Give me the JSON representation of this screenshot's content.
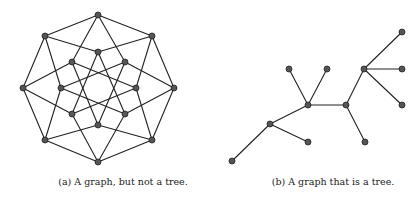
{
  "colors": {
    "edge": "#222222",
    "node_fill": "#555555",
    "node_stroke": "#222222",
    "background": "#ffffff"
  },
  "subfigures": [
    {
      "id": "a",
      "caption": "(a) A graph, but not a tree.",
      "caption_center_x": 123,
      "node_radius": 3,
      "nodes": [
        {
          "id": "0000",
          "x": 98,
          "y": 15
        },
        {
          "id": "1000",
          "x": 152,
          "y": 36
        },
        {
          "id": "1100",
          "x": 174,
          "y": 88
        },
        {
          "id": "1110",
          "x": 152,
          "y": 140
        },
        {
          "id": "1111",
          "x": 98,
          "y": 162
        },
        {
          "id": "0111",
          "x": 45,
          "y": 140
        },
        {
          "id": "0011",
          "x": 23,
          "y": 88
        },
        {
          "id": "0001",
          "x": 45,
          "y": 36
        },
        {
          "id": "1001",
          "x": 98,
          "y": 52
        },
        {
          "id": "0100",
          "x": 125,
          "y": 62
        },
        {
          "id": "1010",
          "x": 136,
          "y": 88
        },
        {
          "id": "1101",
          "x": 125,
          "y": 114
        },
        {
          "id": "0110",
          "x": 98,
          "y": 125
        },
        {
          "id": "1011",
          "x": 72,
          "y": 114
        },
        {
          "id": "0101",
          "x": 61,
          "y": 88
        },
        {
          "id": "0010",
          "x": 72,
          "y": 62
        }
      ],
      "edge_rule": "hypercube-one-bit-flip"
    },
    {
      "id": "b",
      "caption": "(b) A graph that is a tree.",
      "caption_center_x": 333,
      "node_radius": 3,
      "nodes": [
        {
          "id": "n1",
          "x": 402,
          "y": 32
        },
        {
          "id": "n2",
          "x": 364,
          "y": 69
        },
        {
          "id": "n3",
          "x": 402,
          "y": 69
        },
        {
          "id": "n4",
          "x": 402,
          "y": 105
        },
        {
          "id": "n5",
          "x": 289,
          "y": 69
        },
        {
          "id": "n6",
          "x": 327,
          "y": 69
        },
        {
          "id": "n7",
          "x": 308,
          "y": 105
        },
        {
          "id": "n8",
          "x": 346,
          "y": 105
        },
        {
          "id": "n9",
          "x": 270,
          "y": 124
        },
        {
          "id": "n10",
          "x": 308,
          "y": 142
        },
        {
          "id": "n11",
          "x": 365,
          "y": 142
        },
        {
          "id": "n12",
          "x": 232,
          "y": 161
        }
      ],
      "edges": [
        [
          "n2",
          "n1"
        ],
        [
          "n2",
          "n3"
        ],
        [
          "n2",
          "n4"
        ],
        [
          "n2",
          "n8"
        ],
        [
          "n8",
          "n7"
        ],
        [
          "n8",
          "n11"
        ],
        [
          "n7",
          "n5"
        ],
        [
          "n7",
          "n6"
        ],
        [
          "n7",
          "n9"
        ],
        [
          "n9",
          "n10"
        ],
        [
          "n9",
          "n12"
        ]
      ]
    }
  ]
}
